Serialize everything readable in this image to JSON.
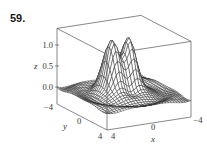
{
  "exercise": {
    "number": "59."
  },
  "chart_data": {
    "type": "surface3d",
    "title": "",
    "xlabel": "x",
    "ylabel": "y",
    "zlabel": "z",
    "xlim": [
      -4,
      4
    ],
    "ylim": [
      -4,
      4
    ],
    "zlim": [
      -0.4,
      1.4
    ],
    "x_ticks": [
      "4",
      "0",
      "−4"
    ],
    "y_ticks": [
      "−4",
      "0",
      "4"
    ],
    "z_ticks": [
      "0.0",
      "0.5",
      "1.0"
    ],
    "grid_resolution": 30,
    "peaks": [
      {
        "x": 0.8,
        "y": -0.6,
        "z": 1.3
      },
      {
        "x": -0.8,
        "y": -0.6,
        "z": 1.3
      }
    ]
  },
  "labels": {
    "z_tick_1": "1.0",
    "z_tick_05": "0.5",
    "z_tick_0": "0.0",
    "z_axis": "z",
    "y_tick_neg4": "−4",
    "y_tick_0": "0",
    "y_tick_4": "4",
    "y_axis": "y",
    "x_tick_4": "4",
    "x_tick_0": "0",
    "x_tick_neg4": "−4",
    "x_axis": "x"
  }
}
